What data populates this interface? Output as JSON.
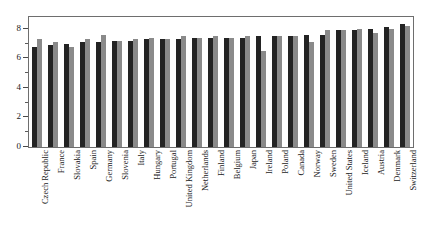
{
  "chart_data": {
    "type": "bar",
    "title": "",
    "subtitle": "",
    "xlabel": "",
    "ylabel": "",
    "ylim": [
      0,
      8.8
    ],
    "yticks": [
      0,
      2,
      4,
      6,
      8
    ],
    "ytick_labels": [
      "0",
      "2",
      "4",
      "6",
      "8"
    ],
    "grid": false,
    "legend": "none",
    "orientation": "vertical",
    "grouped": true,
    "categories": [
      "Czech Republic",
      "France",
      "Slovakia",
      "Spain",
      "Germany",
      "Slovenia",
      "Italy",
      "Hungary",
      "Portugal",
      "United Kingdom",
      "Netherlands",
      "Finland",
      "Belgium",
      "Japan",
      "Ireland",
      "Poland",
      "Canada",
      "Norway",
      "Sweden",
      "United States",
      "Iceland",
      "Austria",
      "Denmark",
      "Switzerland"
    ],
    "series": [
      {
        "name": "series-1",
        "color": "#232323",
        "values": [
          6.8,
          6.9,
          7.0,
          7.1,
          7.1,
          7.2,
          7.2,
          7.3,
          7.3,
          7.3,
          7.4,
          7.4,
          7.4,
          7.4,
          7.5,
          7.5,
          7.5,
          7.6,
          7.6,
          7.9,
          7.9,
          8.0,
          8.1,
          8.3
        ]
      },
      {
        "name": "series-2",
        "color": "#8a8a8a",
        "values": [
          7.3,
          7.1,
          6.8,
          7.3,
          7.6,
          7.2,
          7.3,
          7.4,
          7.3,
          7.5,
          7.4,
          7.5,
          7.4,
          7.5,
          6.5,
          7.5,
          7.5,
          7.1,
          7.9,
          7.9,
          8.0,
          7.7,
          8.0,
          8.2
        ]
      }
    ]
  }
}
